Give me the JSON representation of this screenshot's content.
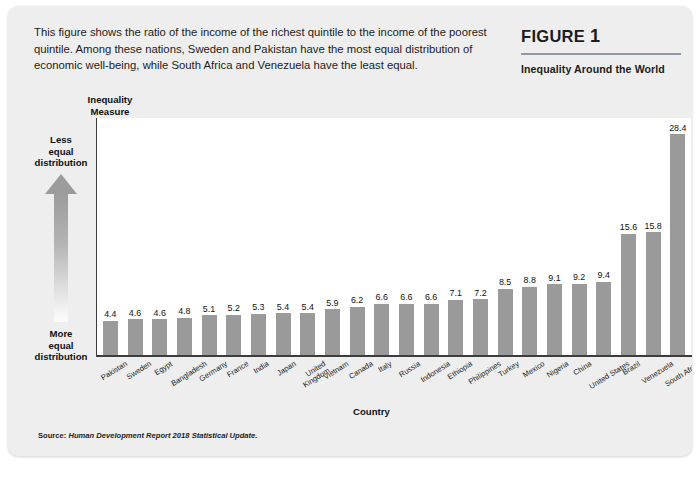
{
  "figure": {
    "caption": "This figure shows the ratio of the income of the richest quintile to the income of the poorest quintile. Among these nations, Sweden and Pakistan have the most equal distribution of economic well-being, while South Africa and Venezuela have the least equal.",
    "label_word": "FIGURE",
    "label_number": "1",
    "subtitle": "Inequality Around the World",
    "source_prefix": "Source:",
    "source_text": "Human Development Report 2018 Statistical Update.",
    "axis_arrow_top": "Less\nequal\ndistribution",
    "axis_arrow_bottom": "More\nequal\ndistribution",
    "bar_color": "#9a9a9a",
    "card_bg": "#eeeeee",
    "rule_color": "#8e98a8"
  },
  "chart_data": {
    "type": "bar",
    "title": "Inequality Around the World",
    "xlabel": "Country",
    "ylabel": "Inequality Measure",
    "ylabel_line1": "Inequality",
    "ylabel_line2": "Measure",
    "ylim": [
      0,
      30.5
    ],
    "grid": false,
    "legend": "none",
    "annotations": [
      "Less equal distribution",
      "More equal distribution"
    ],
    "categories": [
      "Pakistan",
      "Sweden",
      "Egypt",
      "Bangladesh",
      "Germany",
      "France",
      "India",
      "Japan",
      "United Kingdom",
      "Vietnam",
      "Canada",
      "Italy",
      "Russia",
      "Indonesia",
      "Ethiopia",
      "Philippines",
      "Turkey",
      "Mexico",
      "Nigeria",
      "China",
      "United States",
      "Brazil",
      "Venezuela",
      "South Africa"
    ],
    "values": [
      4.4,
      4.6,
      4.6,
      4.8,
      5.1,
      5.2,
      5.3,
      5.4,
      5.4,
      5.9,
      6.2,
      6.6,
      6.6,
      6.6,
      7.1,
      7.2,
      8.5,
      8.8,
      9.1,
      9.2,
      9.4,
      15.6,
      15.8,
      28.4
    ],
    "value_labels": [
      "4.4",
      "4.6",
      "4.6",
      "4.8",
      "5.1",
      "5.2",
      "5.3",
      "5.4",
      "5.4",
      "5.9",
      "6.2",
      "6.6",
      "6.6",
      "6.6",
      "7.1",
      "7.2",
      "8.5",
      "8.8",
      "9.1",
      "9.2",
      "9.4",
      "15.6",
      "15.8",
      "28.4"
    ],
    "category_labels_wrapped": [
      "Pakistan",
      "Sweden",
      "Egypt",
      "Bangladesh",
      "Germany",
      "France",
      "India",
      "Japan",
      "United\nKingdom",
      "Vietnam",
      "Canada",
      "Italy",
      "Russia",
      "Indonesia",
      "Ethiopia",
      "Philippines",
      "Turkey",
      "Mexico",
      "Nigeria",
      "China",
      "United States",
      "Brazil",
      "Venezuela",
      "South Africa"
    ]
  }
}
